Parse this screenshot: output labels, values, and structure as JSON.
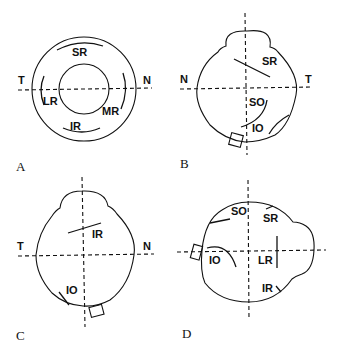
{
  "panels": [
    {
      "id": "A",
      "label": "A",
      "orientation": {
        "left": "T",
        "right": "N"
      },
      "muscles": [
        "SR",
        "LR",
        "MR",
        "IR"
      ]
    },
    {
      "id": "B",
      "label": "B",
      "orientation": {
        "left": "N",
        "right": "T"
      },
      "muscles": [
        "SR",
        "SO",
        "IO"
      ]
    },
    {
      "id": "C",
      "label": "C",
      "orientation": {
        "left": "T",
        "right": "N"
      },
      "muscles": [
        "IR",
        "IO"
      ]
    },
    {
      "id": "D",
      "label": "D",
      "orientation": {},
      "muscles": [
        "SO",
        "SR",
        "IO",
        "LR",
        "IR"
      ]
    }
  ],
  "colors": {
    "ink": "#111111",
    "background": "#ffffff"
  }
}
